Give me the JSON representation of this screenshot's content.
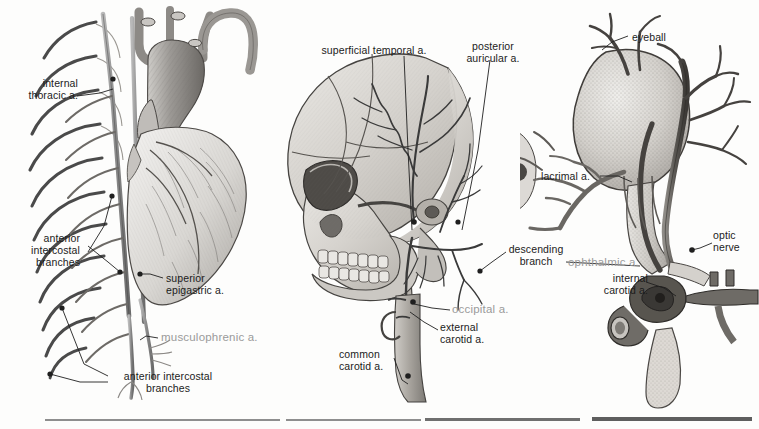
{
  "figure": {
    "background_color": "#fdfdfc",
    "ink_color": "#1b1b1b",
    "muted_label_color": "#9a9a9a",
    "width": 759,
    "height": 429
  },
  "panels": [
    {
      "id": "panel-thorax",
      "name": "thoracic-arteries-panel",
      "subject": "heart, aortic arch, rib cage and internal thoracic artery",
      "labels": [
        {
          "id": "internal-thoracic",
          "text": "internal\nthoracic a.",
          "align": "right",
          "muted": false,
          "x": 10,
          "y": 77
        },
        {
          "id": "anterior-intercostal-branches-upper",
          "text": "anterior\nintercostal\nbranches",
          "align": "right",
          "muted": false,
          "x": 10,
          "y": 232
        },
        {
          "id": "superior-epigastric",
          "text": "superior\nepigastric a.",
          "align": "left",
          "muted": false,
          "x": 165,
          "y": 272
        },
        {
          "id": "musculophrenic",
          "text": "musculophrenic a.",
          "align": "left",
          "muted": true,
          "x": 160,
          "y": 336
        },
        {
          "id": "anterior-intercostal-branches-lower",
          "text": "anterior intercostal\nbranches",
          "align": "left",
          "muted": false,
          "x": 110,
          "y": 371
        }
      ]
    },
    {
      "id": "panel-skull",
      "name": "skull-arteries-panel",
      "subject": "lateral skull with superficial temporal, posterior auricular, occipital and carotid arteries",
      "labels": [
        {
          "id": "superficial-temporal",
          "text": "superficial temporal a.",
          "align": "center",
          "muted": false,
          "x": 311,
          "y": 44
        },
        {
          "id": "posterior-auricular",
          "text": "posterior\nauricular a.",
          "align": "center",
          "muted": false,
          "x": 464,
          "y": 44
        },
        {
          "id": "descending-branch",
          "text": "descending\nbranch",
          "align": "left",
          "muted": false,
          "x": 508,
          "y": 243
        },
        {
          "id": "occipital",
          "text": "occipital a.",
          "align": "left",
          "muted": true,
          "x": 452,
          "y": 303
        },
        {
          "id": "external-carotid",
          "text": "external\ncarotid a.",
          "align": "left",
          "muted": false,
          "x": 440,
          "y": 322
        },
        {
          "id": "common-carotid",
          "text": "common\ncarotid a.",
          "align": "left",
          "muted": false,
          "x": 339,
          "y": 348
        }
      ]
    },
    {
      "id": "panel-orbit",
      "name": "orbital-arteries-panel",
      "subject": "eyeball, optic nerve, ophthalmic and internal carotid arteries",
      "labels": [
        {
          "id": "eyeball",
          "text": "eyeball",
          "align": "left",
          "muted": false,
          "x": 632,
          "y": 32
        },
        {
          "id": "lacrimal",
          "text": "lacrimal a.",
          "align": "left",
          "muted": false,
          "x": 543,
          "y": 174
        },
        {
          "id": "optic-nerve",
          "text": "optic\nnerve",
          "align": "left",
          "muted": false,
          "x": 712,
          "y": 230
        },
        {
          "id": "ophthalmic",
          "text": "ophthalmic a.",
          "align": "left",
          "muted": true,
          "x": 569,
          "y": 256
        },
        {
          "id": "internal-carotid",
          "text": "internal\ncarotid a.",
          "align": "left",
          "muted": false,
          "x": 596,
          "y": 272
        }
      ]
    }
  ],
  "bottom_rules": [
    {
      "id": "rule-1",
      "x": 45,
      "width": 235,
      "weight": "light"
    },
    {
      "id": "rule-2",
      "x": 286,
      "width": 135,
      "weight": "light"
    },
    {
      "id": "rule-3",
      "x": 425,
      "width": 155,
      "weight": "dark"
    },
    {
      "id": "rule-4",
      "x": 592,
      "width": 160,
      "weight": "darkest"
    }
  ]
}
